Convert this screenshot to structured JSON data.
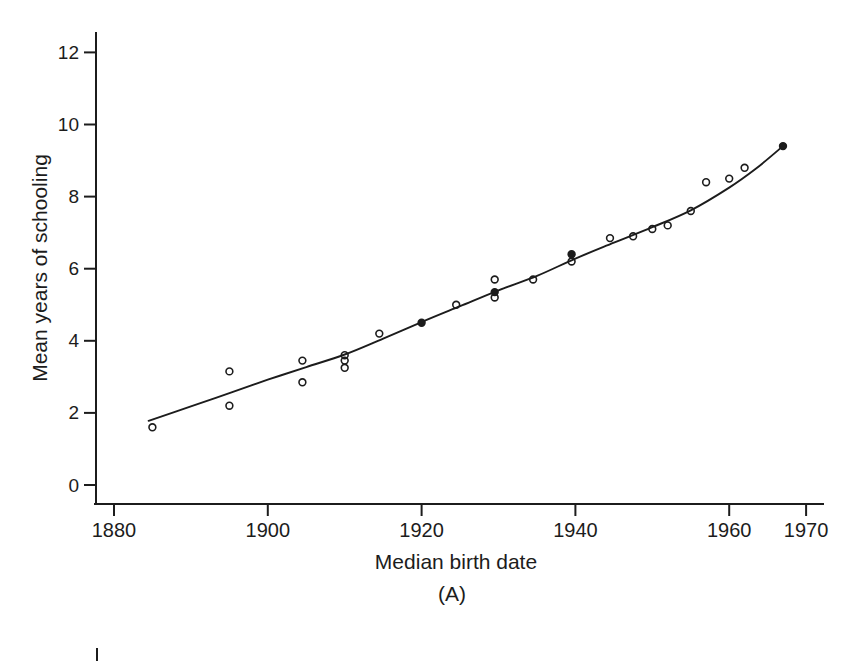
{
  "figure": {
    "panel_label": "(A)",
    "background_color": "#ffffff",
    "ink_color": "#1c1c1c"
  },
  "chart_data": {
    "type": "scatter",
    "title": "",
    "xlabel": "Median birth date",
    "ylabel": "Mean years of schooling",
    "panel_label": "(A)",
    "grid": false,
    "legend": "none",
    "marker": "open-circle",
    "ink_color": "#1c1c1c",
    "x_ticks": [
      "1880",
      "1900",
      "1920",
      "1940",
      "1960",
      "1970"
    ],
    "x_tick_values": [
      1880,
      1900,
      1920,
      1940,
      1960,
      1970
    ],
    "y_ticks": [
      "0",
      "2",
      "4",
      "6",
      "8",
      "10",
      "12"
    ],
    "y_tick_values": [
      0,
      2,
      4,
      6,
      8,
      10,
      12
    ],
    "xlim": [
      1877.6,
      1972.2
    ],
    "ylim": [
      -0.55,
      12.55
    ],
    "points": [
      {
        "x": 1885,
        "y": 1.6,
        "filled": false
      },
      {
        "x": 1895,
        "y": 3.15,
        "filled": false
      },
      {
        "x": 1895,
        "y": 2.2,
        "filled": false
      },
      {
        "x": 1904.5,
        "y": 3.45,
        "filled": false
      },
      {
        "x": 1904.5,
        "y": 2.85,
        "filled": false
      },
      {
        "x": 1910,
        "y": 3.6,
        "filled": false
      },
      {
        "x": 1910,
        "y": 3.45,
        "filled": false
      },
      {
        "x": 1910,
        "y": 3.25,
        "filled": false
      },
      {
        "x": 1914.5,
        "y": 4.2,
        "filled": false
      },
      {
        "x": 1920,
        "y": 4.5,
        "filled": true
      },
      {
        "x": 1924.5,
        "y": 5.0,
        "filled": false
      },
      {
        "x": 1929.5,
        "y": 5.7,
        "filled": false
      },
      {
        "x": 1929.5,
        "y": 5.35,
        "filled": true
      },
      {
        "x": 1929.5,
        "y": 5.2,
        "filled": false
      },
      {
        "x": 1934.5,
        "y": 5.7,
        "filled": false
      },
      {
        "x": 1939.5,
        "y": 6.4,
        "filled": true
      },
      {
        "x": 1939.5,
        "y": 6.2,
        "filled": false
      },
      {
        "x": 1944.5,
        "y": 6.85,
        "filled": false
      },
      {
        "x": 1947.5,
        "y": 6.9,
        "filled": false
      },
      {
        "x": 1950,
        "y": 7.1,
        "filled": false
      },
      {
        "x": 1952,
        "y": 7.2,
        "filled": false
      },
      {
        "x": 1955,
        "y": 7.6,
        "filled": false
      },
      {
        "x": 1957,
        "y": 8.4,
        "filled": false
      },
      {
        "x": 1960,
        "y": 8.5,
        "filled": false
      },
      {
        "x": 1962,
        "y": 8.8,
        "filled": false
      },
      {
        "x": 1967,
        "y": 9.4,
        "filled": true
      }
    ],
    "trend_line": [
      [
        1884.5,
        1.78
      ],
      [
        1890,
        2.18
      ],
      [
        1895,
        2.55
      ],
      [
        1900,
        2.92
      ],
      [
        1905,
        3.27
      ],
      [
        1910,
        3.62
      ],
      [
        1915,
        4.06
      ],
      [
        1920,
        4.52
      ],
      [
        1925,
        4.96
      ],
      [
        1930,
        5.4
      ],
      [
        1935,
        5.8
      ],
      [
        1940,
        6.28
      ],
      [
        1945,
        6.72
      ],
      [
        1950,
        7.15
      ],
      [
        1955,
        7.62
      ],
      [
        1960,
        8.25
      ],
      [
        1963.5,
        8.78
      ],
      [
        1967,
        9.4
      ]
    ]
  }
}
